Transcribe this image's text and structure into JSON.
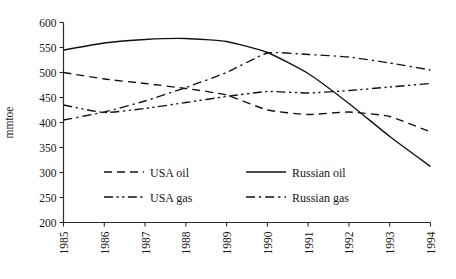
{
  "chart_data": {
    "type": "line",
    "title": "",
    "xlabel": "",
    "ylabel": "mmtoe",
    "x": [
      1985,
      1986,
      1987,
      1988,
      1989,
      1990,
      1991,
      1992,
      1993,
      1994
    ],
    "categories": [
      "1985",
      "1986",
      "1987",
      "1988",
      "1989",
      "1990",
      "1991",
      "1992",
      "1993",
      "1994"
    ],
    "xlim": [
      1985,
      1994
    ],
    "ylim": [
      200,
      600
    ],
    "yticks": [
      200,
      250,
      300,
      350,
      400,
      450,
      500,
      550,
      600
    ],
    "ytick_labels": [
      "200",
      "250",
      "300",
      "350",
      "400",
      "450",
      "500",
      "550",
      "600"
    ],
    "grid": false,
    "legend_position": "inside-lower-left",
    "series": [
      {
        "name": "USA oil",
        "style": "dashed",
        "values": [
          500,
          487,
          478,
          468,
          455,
          425,
          416,
          421,
          412,
          381
        ]
      },
      {
        "name": "Russian oil",
        "style": "solid",
        "values": [
          545,
          559,
          566,
          568,
          562,
          540,
          498,
          438,
          372,
          312
        ]
      },
      {
        "name": "USA gas",
        "style": "dash-dot-dot",
        "values": [
          435,
          420,
          428,
          440,
          452,
          462,
          459,
          464,
          471,
          478
        ]
      },
      {
        "name": "Russian gas",
        "style": "dash-dot",
        "values": [
          405,
          421,
          443,
          470,
          500,
          539,
          536,
          531,
          519,
          505
        ]
      }
    ]
  },
  "legend": {
    "entries": [
      {
        "label": "USA oil",
        "style": "dashed"
      },
      {
        "label": "Russian oil",
        "style": "solid"
      },
      {
        "label": "USA gas",
        "style": "dash-dot-dot"
      },
      {
        "label": "Russian gas",
        "style": "dash-dot"
      }
    ]
  },
  "axes": {
    "y_title": "mmtoe"
  }
}
